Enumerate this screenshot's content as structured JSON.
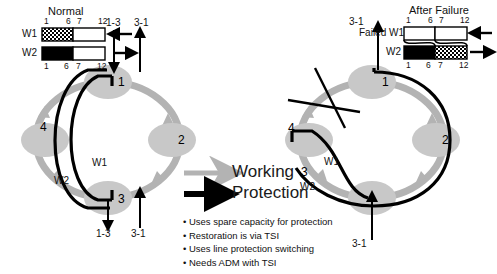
{
  "diagram": {
    "colors": {
      "working_arrow": "#b3b3b3",
      "protection_arrow": "#000000",
      "node_fill": "#c8c8c8",
      "background": "#ffffff",
      "text": "#111111"
    },
    "legend_left": {
      "title": "Normal",
      "ticks_top": [
        "1",
        "6",
        "7",
        "12"
      ],
      "ticks_bottom": [
        "1",
        "6",
        "7",
        "12"
      ],
      "rows": [
        {
          "label": "W1",
          "left_fill": "checkered",
          "right_fill": "white",
          "arrow": "left"
        },
        {
          "label": "W2",
          "left_fill": "black",
          "right_fill": "white",
          "arrow": "right"
        }
      ]
    },
    "legend_right": {
      "title": "After Failure",
      "ticks_top": [
        "1",
        "6",
        "7",
        "12"
      ],
      "ticks_bottom": [
        "1",
        "6",
        "7",
        "12"
      ],
      "rows": [
        {
          "label": "Failed W1",
          "left_fill": "white",
          "right_fill": "white",
          "arrow": "left"
        },
        {
          "label": "W2",
          "left_fill": "black",
          "right_fill": "checkered",
          "arrow": "right"
        }
      ]
    },
    "key": {
      "working_label": "Working",
      "protection_label": "Protection"
    },
    "bullets": [
      "• Uses spare capacity for protection",
      "• Restoration is via TSI",
      "• Uses line protection switching",
      "• Needs ADM with TSI"
    ],
    "ring_left": {
      "name": "Normal operation ring",
      "nodes": [
        {
          "id": "1",
          "label": "1"
        },
        {
          "id": "2",
          "label": "2"
        },
        {
          "id": "3",
          "label": "3"
        },
        {
          "id": "4",
          "label": "4"
        }
      ],
      "path_labels": [
        {
          "id": "w1",
          "label": "W1"
        },
        {
          "id": "w2",
          "label": "W2"
        }
      ],
      "flows": [
        {
          "id": "top-in",
          "label": "1-3"
        },
        {
          "id": "top-out",
          "label": "3-1"
        },
        {
          "id": "bottom-out",
          "label": "1-3"
        },
        {
          "id": "bottom-in",
          "label": "3-1"
        }
      ]
    },
    "ring_right": {
      "name": "After failure ring",
      "failure_marker": "X",
      "nodes": [
        {
          "id": "1",
          "label": "1"
        },
        {
          "id": "2",
          "label": "2"
        },
        {
          "id": "3",
          "label": "3"
        },
        {
          "id": "4",
          "label": "4"
        }
      ],
      "path_labels": [
        {
          "id": "w1",
          "label": "W1"
        },
        {
          "id": "w2",
          "label": "W2"
        }
      ],
      "flows": [
        {
          "id": "top-out",
          "label": "3-1"
        },
        {
          "id": "bottom-in",
          "label": "3-1"
        }
      ]
    }
  }
}
